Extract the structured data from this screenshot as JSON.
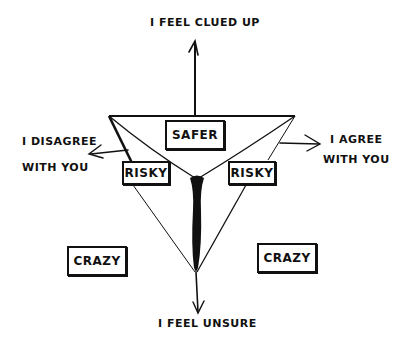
{
  "diagram": {
    "axes": {
      "top": "I FEEL CLUED UP",
      "bottom": "I FEEL UNSURE",
      "left": {
        "line1": "I DISAGREE",
        "line2": "WITH YOU"
      },
      "right": {
        "line1": "I AGREE",
        "line2": "WITH YOU"
      }
    },
    "zones": {
      "center_top": "SAFER",
      "left_inner": "RISKY",
      "right_inner": "RISKY",
      "left_outer": "CRAZY",
      "right_outer": "CRAZY"
    },
    "colors": {
      "ink": "#111111",
      "background": "#ffffff"
    }
  }
}
